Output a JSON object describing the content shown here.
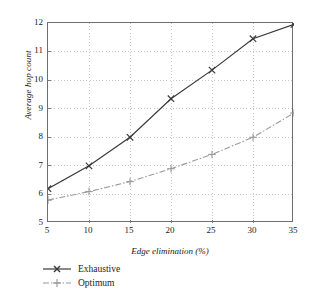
{
  "chart_data": {
    "type": "line",
    "title": "",
    "xlabel": "Edge elimination (%)",
    "ylabel": "Average hop count",
    "x": [
      5,
      10,
      15,
      20,
      25,
      30,
      35
    ],
    "xticklabels": [
      "5",
      "10",
      "15",
      "20",
      "25",
      "30",
      "35"
    ],
    "yticklabels": [
      "5",
      "6",
      "7",
      "8",
      "9",
      "10",
      "11",
      "12"
    ],
    "yticks": [
      5,
      6,
      7,
      8,
      9,
      10,
      11,
      12
    ],
    "xlim": [
      5,
      35
    ],
    "ylim": [
      5,
      12
    ],
    "grid": true,
    "grid_style": "dotted",
    "grid_color": "#b9b9b9",
    "legend_position": "below-left",
    "series": [
      {
        "name": "Exhaustive",
        "marker": "x",
        "linestyle": "solid",
        "color": "#3a3a3a",
        "values": [
          6.2,
          7.0,
          8.0,
          9.35,
          10.35,
          11.45,
          11.95
        ]
      },
      {
        "name": "Optimum",
        "marker": "+",
        "linestyle": "dashdot",
        "color": "#9a9a9a",
        "values": [
          5.8,
          6.1,
          6.45,
          6.9,
          7.4,
          8.0,
          8.85
        ]
      }
    ]
  },
  "axes": {
    "y_title": "Average hop count",
    "x_title": "Edge elimination (%)",
    "y_ticks": [
      {
        "label": "12"
      },
      {
        "label": "11"
      },
      {
        "label": "10"
      },
      {
        "label": "9"
      },
      {
        "label": "8"
      },
      {
        "label": "7"
      },
      {
        "label": "6"
      },
      {
        "label": "5"
      }
    ],
    "x_ticks": [
      {
        "label": "5"
      },
      {
        "label": "10"
      },
      {
        "label": "15"
      },
      {
        "label": "20"
      },
      {
        "label": "25"
      },
      {
        "label": "30"
      },
      {
        "label": "35"
      }
    ]
  },
  "legend": {
    "items": [
      {
        "label": "Exhaustive"
      },
      {
        "label": "Optimum"
      }
    ]
  },
  "colors": {
    "frame": "#6e6e6e",
    "grid": "#b9b9b9",
    "exhaustive": "#3a3a3a",
    "optimum": "#9a9a9a",
    "background": "#ffffff",
    "text": "#1a1a1a"
  }
}
